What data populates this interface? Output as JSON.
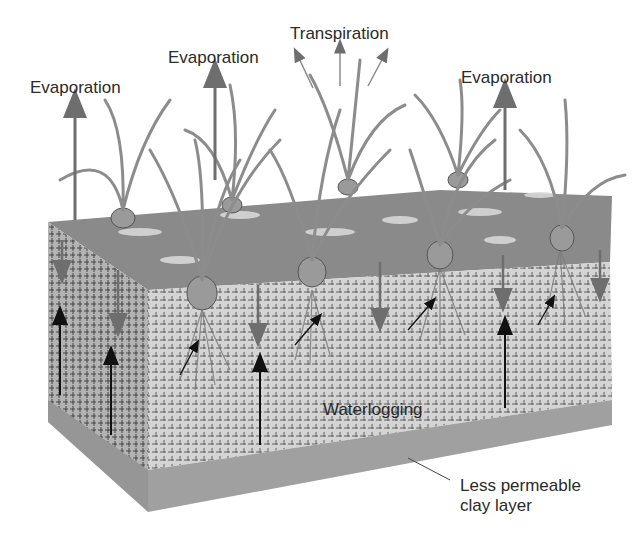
{
  "diagram": {
    "topic": "Waterlogging of soil over less permeable clay layer",
    "labels": {
      "evaporation_left": "Evaporation",
      "evaporation_middle": "Evaporation",
      "transpiration": "Transpiration",
      "evaporation_right": "Evaporation",
      "waterlogging": "Waterlogging",
      "clay_layer": "Less permeable\nclay layer"
    },
    "colors": {
      "soil_surface": "#8a8a8a",
      "soil_front": "#cfcfcf",
      "soil_side": "#a9a9a9",
      "clay_layer": "#a0a0a0",
      "arrow_dark": "#111111",
      "arrow_grey": "#6e6e6e",
      "plant": "#8c8c8c",
      "text": "#2a2a2a"
    }
  }
}
